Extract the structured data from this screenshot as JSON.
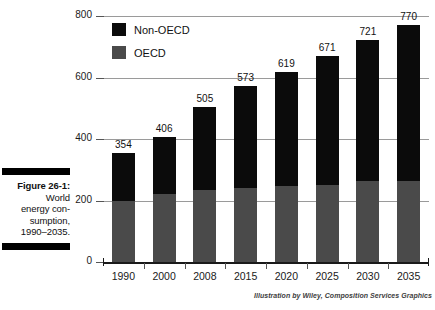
{
  "figure": {
    "label": "Figure 26-1:",
    "caption_lines": [
      "World",
      "energy con-",
      "sumption,",
      "1990–2035."
    ]
  },
  "credit": "Illustration by Wiley, Composition Services Graphics",
  "legend": {
    "position": "top-left-inside",
    "items": [
      {
        "name": "Non-OECD",
        "color": "#0b0b0b"
      },
      {
        "name": "OECD",
        "color": "#4a4a4a"
      }
    ]
  },
  "chart_data": {
    "type": "bar",
    "subtype": "stacked-vertical",
    "xlabel": "",
    "ylabel": "",
    "ylim": [
      0,
      800
    ],
    "yticks": [
      0,
      200,
      400,
      600,
      800
    ],
    "ytick_labels": [
      "0",
      "200",
      "400",
      "600",
      "800"
    ],
    "grid": true,
    "grid_axis": "y",
    "legend_position": "upper left",
    "categories": [
      "1990",
      "2000",
      "2008",
      "2015",
      "2020",
      "2025",
      "2030",
      "2035"
    ],
    "series": [
      {
        "name": "OECD",
        "color": "#4a4a4a",
        "values": [
          198,
          221,
          235,
          240,
          248,
          252,
          262,
          265
        ]
      },
      {
        "name": "Non-OECD",
        "color": "#0b0b0b",
        "values": [
          156,
          185,
          270,
          333,
          371,
          419,
          459,
          505
        ]
      }
    ],
    "totals": [
      354,
      406,
      505,
      573,
      619,
      671,
      721,
      770
    ],
    "data_labels": [
      "354",
      "406",
      "505",
      "573",
      "619",
      "671",
      "721",
      "770"
    ],
    "data_label_position": "above-bar"
  }
}
